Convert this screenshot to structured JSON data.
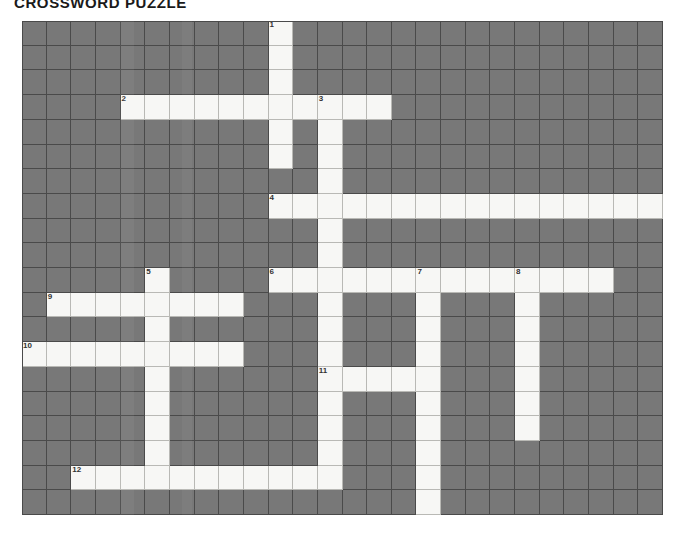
{
  "title": "CROSSWORD PUZZLE",
  "grid": {
    "columns": 26,
    "rows": 20,
    "cell_size_px": 24.65,
    "colors": {
      "blocked": "#787878",
      "open": "#f7f7f5",
      "gridline": "#4a4a4a",
      "number": "#333333",
      "page_background": "#ffffff"
    }
  },
  "clue_numbers": [
    {
      "number": 1,
      "row": 0,
      "col": 10,
      "direction": "down"
    },
    {
      "number": 2,
      "row": 3,
      "col": 4,
      "direction": "across"
    },
    {
      "number": 3,
      "row": 3,
      "col": 12,
      "direction": "down"
    },
    {
      "number": 4,
      "row": 7,
      "col": 10,
      "direction": "across"
    },
    {
      "number": 5,
      "row": 10,
      "col": 5,
      "direction": "down"
    },
    {
      "number": 6,
      "row": 10,
      "col": 10,
      "direction": "across"
    },
    {
      "number": 7,
      "row": 10,
      "col": 16,
      "direction": "down"
    },
    {
      "number": 8,
      "row": 10,
      "col": 20,
      "direction": "down"
    },
    {
      "number": 9,
      "row": 11,
      "col": 1,
      "direction": "across"
    },
    {
      "number": 10,
      "row": 13,
      "col": 0,
      "direction": "across"
    },
    {
      "number": 11,
      "row": 14,
      "col": 12,
      "direction": "across"
    },
    {
      "number": 12,
      "row": 18,
      "col": 2,
      "direction": "across"
    }
  ],
  "entries": [
    {
      "number": 1,
      "direction": "down",
      "row": 0,
      "col": 10,
      "length": 6
    },
    {
      "number": 2,
      "direction": "across",
      "row": 3,
      "col": 4,
      "length": 11
    },
    {
      "number": 3,
      "direction": "down",
      "row": 3,
      "col": 12,
      "length": 15
    },
    {
      "number": 4,
      "direction": "across",
      "row": 7,
      "col": 10,
      "length": 16
    },
    {
      "number": 5,
      "direction": "down",
      "row": 10,
      "col": 5,
      "length": 9
    },
    {
      "number": 6,
      "direction": "across",
      "row": 10,
      "col": 10,
      "length": 14
    },
    {
      "number": 7,
      "direction": "down",
      "row": 10,
      "col": 16,
      "length": 10
    },
    {
      "number": 8,
      "direction": "down",
      "row": 10,
      "col": 20,
      "length": 7
    },
    {
      "number": 9,
      "direction": "across",
      "row": 11,
      "col": 1,
      "length": 8
    },
    {
      "number": 10,
      "direction": "across",
      "row": 13,
      "col": 0,
      "length": 9
    },
    {
      "number": 11,
      "direction": "across",
      "row": 14,
      "col": 12,
      "length": 5
    },
    {
      "number": 12,
      "direction": "across",
      "row": 18,
      "col": 2,
      "length": 11
    }
  ],
  "open_cells": [
    [
      0,
      10
    ],
    [
      1,
      10
    ],
    [
      2,
      10
    ],
    [
      3,
      4
    ],
    [
      3,
      5
    ],
    [
      3,
      6
    ],
    [
      3,
      7
    ],
    [
      3,
      8
    ],
    [
      3,
      9
    ],
    [
      3,
      10
    ],
    [
      3,
      11
    ],
    [
      3,
      12
    ],
    [
      3,
      13
    ],
    [
      3,
      14
    ],
    [
      4,
      10
    ],
    [
      4,
      12
    ],
    [
      5,
      10
    ],
    [
      5,
      12
    ],
    [
      6,
      12
    ],
    [
      7,
      10
    ],
    [
      7,
      11
    ],
    [
      7,
      12
    ],
    [
      7,
      13
    ],
    [
      7,
      14
    ],
    [
      7,
      15
    ],
    [
      7,
      16
    ],
    [
      7,
      17
    ],
    [
      7,
      18
    ],
    [
      7,
      19
    ],
    [
      7,
      20
    ],
    [
      7,
      21
    ],
    [
      7,
      22
    ],
    [
      7,
      23
    ],
    [
      7,
      24
    ],
    [
      7,
      25
    ],
    [
      8,
      12
    ],
    [
      9,
      12
    ],
    [
      10,
      5
    ],
    [
      10,
      10
    ],
    [
      10,
      11
    ],
    [
      10,
      12
    ],
    [
      10,
      13
    ],
    [
      10,
      14
    ],
    [
      10,
      15
    ],
    [
      10,
      16
    ],
    [
      10,
      17
    ],
    [
      10,
      18
    ],
    [
      10,
      19
    ],
    [
      10,
      20
    ],
    [
      10,
      21
    ],
    [
      10,
      22
    ],
    [
      10,
      23
    ],
    [
      11,
      1
    ],
    [
      11,
      2
    ],
    [
      11,
      3
    ],
    [
      11,
      4
    ],
    [
      11,
      5
    ],
    [
      11,
      6
    ],
    [
      11,
      7
    ],
    [
      11,
      8
    ],
    [
      11,
      12
    ],
    [
      11,
      16
    ],
    [
      11,
      20
    ],
    [
      12,
      5
    ],
    [
      12,
      12
    ],
    [
      12,
      16
    ],
    [
      12,
      20
    ],
    [
      13,
      0
    ],
    [
      13,
      1
    ],
    [
      13,
      2
    ],
    [
      13,
      3
    ],
    [
      13,
      4
    ],
    [
      13,
      5
    ],
    [
      13,
      6
    ],
    [
      13,
      7
    ],
    [
      13,
      8
    ],
    [
      13,
      12
    ],
    [
      13,
      16
    ],
    [
      13,
      20
    ],
    [
      14,
      5
    ],
    [
      14,
      12
    ],
    [
      14,
      13
    ],
    [
      14,
      14
    ],
    [
      14,
      15
    ],
    [
      14,
      16
    ],
    [
      14,
      20
    ],
    [
      15,
      5
    ],
    [
      15,
      12
    ],
    [
      15,
      16
    ],
    [
      15,
      20
    ],
    [
      16,
      5
    ],
    [
      16,
      12
    ],
    [
      16,
      16
    ],
    [
      16,
      20
    ],
    [
      17,
      5
    ],
    [
      17,
      12
    ],
    [
      17,
      16
    ],
    [
      18,
      2
    ],
    [
      18,
      3
    ],
    [
      18,
      4
    ],
    [
      18,
      5
    ],
    [
      18,
      6
    ],
    [
      18,
      7
    ],
    [
      18,
      8
    ],
    [
      18,
      9
    ],
    [
      18,
      10
    ],
    [
      18,
      11
    ],
    [
      18,
      12
    ],
    [
      18,
      16
    ],
    [
      19,
      16
    ]
  ]
}
